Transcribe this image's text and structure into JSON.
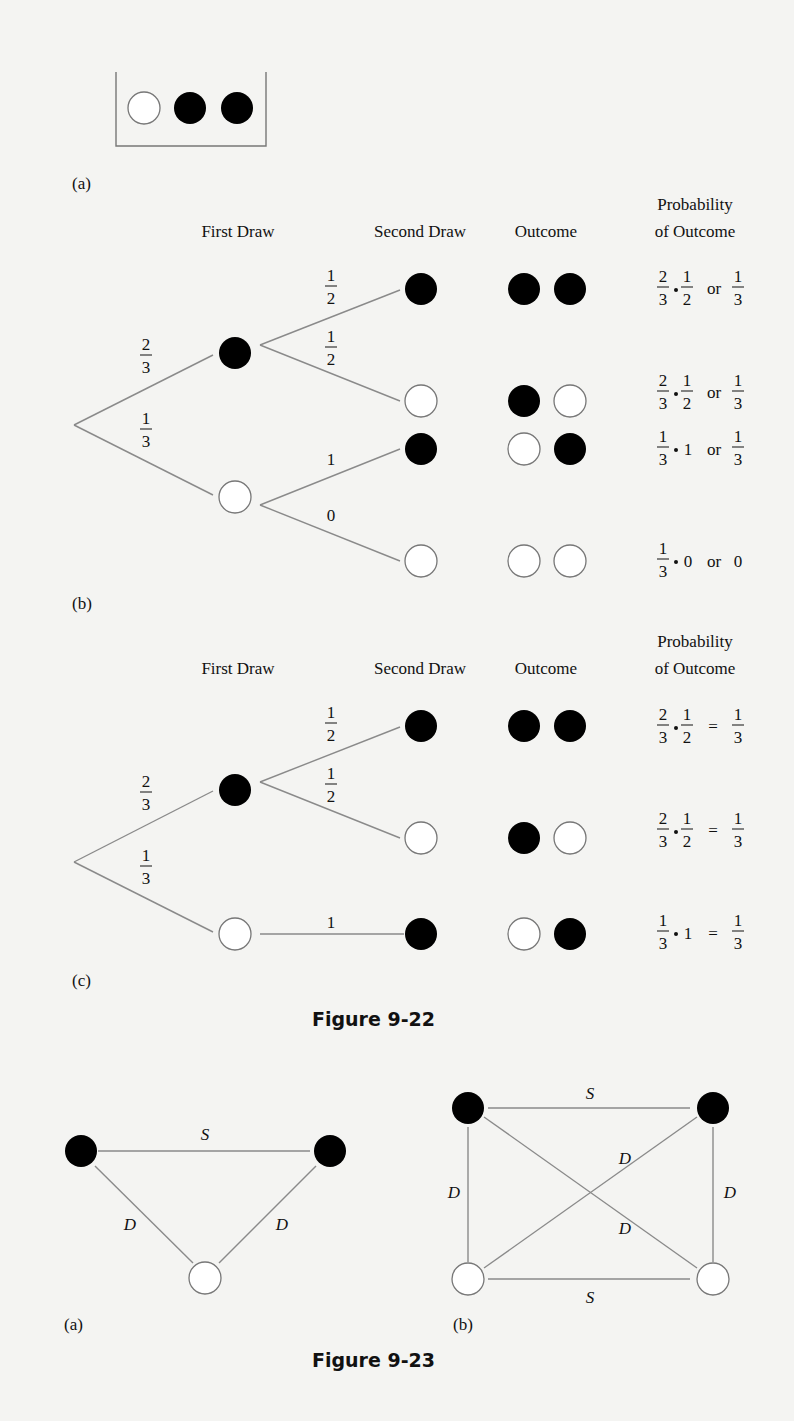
{
  "figure_9_22": {
    "caption": "Figure 9-22",
    "part_a": {
      "label": "(a)",
      "container_balls": [
        "white",
        "black",
        "black"
      ]
    },
    "part_b": {
      "label": "(b)",
      "headers": {
        "first_draw": "First Draw",
        "second_draw": "Second Draw",
        "outcome": "Outcome",
        "probability_line1": "Probability",
        "probability_line2": "of Outcome"
      },
      "first_branches": [
        {
          "prob_num": "2",
          "prob_den": "3",
          "ball": "black"
        },
        {
          "prob_num": "1",
          "prob_den": "3",
          "ball": "white"
        }
      ],
      "second_branches": [
        {
          "from": "black",
          "prob_num": "1",
          "prob_den": "2",
          "ball": "black"
        },
        {
          "from": "black",
          "prob_num": "1",
          "prob_den": "2",
          "ball": "white"
        },
        {
          "from": "white",
          "prob": "1",
          "ball": "black"
        },
        {
          "from": "white",
          "prob": "0",
          "ball": "white"
        }
      ],
      "outcomes": [
        {
          "balls": [
            "black",
            "black"
          ],
          "f1n": "2",
          "f1d": "3",
          "mult": "1",
          "mult_den": "2",
          "joiner": "or",
          "rn": "1",
          "rd": "3"
        },
        {
          "balls": [
            "black",
            "white"
          ],
          "f1n": "2",
          "f1d": "3",
          "mult": "1",
          "mult_den": "2",
          "joiner": "or",
          "rn": "1",
          "rd": "3"
        },
        {
          "balls": [
            "white",
            "black"
          ],
          "f1n": "1",
          "f1d": "3",
          "mult": "1",
          "joiner": "or",
          "rn": "1",
          "rd": "3"
        },
        {
          "balls": [
            "white",
            "white"
          ],
          "f1n": "1",
          "f1d": "3",
          "mult": "0",
          "joiner": "or",
          "result": "0"
        }
      ]
    },
    "part_c": {
      "label": "(c)",
      "headers": {
        "first_draw": "First Draw",
        "second_draw": "Second Draw",
        "outcome": "Outcome",
        "probability_line1": "Probability",
        "probability_line2": "of Outcome"
      },
      "first_branches": [
        {
          "prob_num": "2",
          "prob_den": "3",
          "ball": "black"
        },
        {
          "prob_num": "1",
          "prob_den": "3",
          "ball": "white"
        }
      ],
      "second_branches": [
        {
          "from": "black",
          "prob_num": "1",
          "prob_den": "2",
          "ball": "black"
        },
        {
          "from": "black",
          "prob_num": "1",
          "prob_den": "2",
          "ball": "white"
        },
        {
          "from": "white",
          "prob": "1",
          "ball": "black"
        }
      ],
      "outcomes": [
        {
          "balls": [
            "black",
            "black"
          ],
          "f1n": "2",
          "f1d": "3",
          "mult": "1",
          "mult_den": "2",
          "joiner": "=",
          "rn": "1",
          "rd": "3"
        },
        {
          "balls": [
            "black",
            "white"
          ],
          "f1n": "2",
          "f1d": "3",
          "mult": "1",
          "mult_den": "2",
          "joiner": "=",
          "rn": "1",
          "rd": "3"
        },
        {
          "balls": [
            "white",
            "black"
          ],
          "f1n": "1",
          "f1d": "3",
          "mult": "1",
          "joiner": "=",
          "rn": "1",
          "rd": "3"
        }
      ]
    }
  },
  "figure_9_23": {
    "caption": "Figure 9-23",
    "part_a": {
      "label": "(a)",
      "nodes": [
        "black",
        "black",
        "white"
      ],
      "edges": [
        {
          "between": "black-black",
          "label": "S"
        },
        {
          "between": "black-white",
          "label": "D"
        },
        {
          "between": "black-white",
          "label": "D"
        }
      ]
    },
    "part_b": {
      "label": "(b)",
      "nodes": [
        "black",
        "black",
        "white",
        "white"
      ],
      "edges": [
        {
          "between": "top-left to top-right",
          "label": "S"
        },
        {
          "between": "bottom-left to bottom-right",
          "label": "S"
        },
        {
          "between": "top-left to bottom-left",
          "label": "D"
        },
        {
          "between": "top-right to bottom-right",
          "label": "D"
        },
        {
          "between": "top-right to bottom-left",
          "label": "D"
        },
        {
          "between": "top-left to bottom-right",
          "label": "D"
        }
      ]
    }
  }
}
